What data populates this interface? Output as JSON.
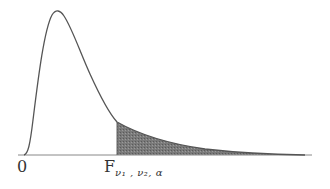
{
  "diagram": {
    "type": "probability-density-curve",
    "distribution": "F",
    "labels": {
      "origin": "0",
      "critical_value_main": "F",
      "critical_value_subscript": "ν₁ , ν₂, α"
    },
    "shaded_region": "upper tail to the right of F critical value (area α)",
    "colors": {
      "curve": "#555555",
      "axis": "#777777",
      "shade": "#6a6a6a",
      "background": "#ffffff"
    }
  }
}
